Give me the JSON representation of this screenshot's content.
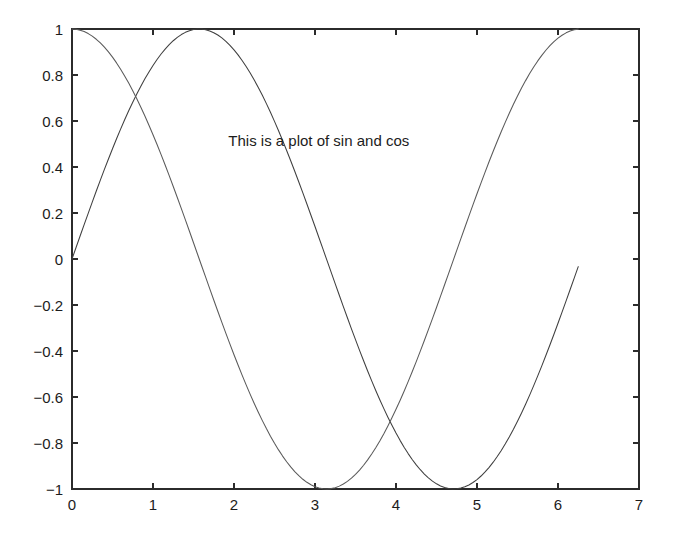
{
  "figure": {
    "background_color": "#ffffff",
    "axes_color": "#2b2b2b",
    "text_color": "#1c1c1c"
  },
  "chart_data": {
    "type": "line",
    "title": "",
    "subtitle": "",
    "xlabel": "",
    "ylabel": "",
    "xlim": [
      0,
      7
    ],
    "ylim": [
      -1,
      1
    ],
    "grid": false,
    "legend": null,
    "legend_position": "none",
    "box": true,
    "tick_direction": "in",
    "xticks": [
      0,
      1,
      2,
      3,
      4,
      5,
      6,
      7
    ],
    "xticklabels": [
      "0",
      "1",
      "2",
      "3",
      "4",
      "5",
      "6",
      "7"
    ],
    "yticks": [
      -1,
      -0.8,
      -0.6,
      -0.4,
      -0.2,
      0,
      0.2,
      0.4,
      0.6,
      0.8,
      1
    ],
    "yticklabels": [
      "-1",
      "-0.8",
      "-0.6",
      "-0.4",
      "-0.2",
      "0",
      "0.2",
      "0.4",
      "0.6",
      "0.8",
      "1"
    ],
    "x_domain_of_data": [
      0,
      6.2832
    ],
    "x_step": 0.05,
    "series": [
      {
        "name": "sin",
        "function": "sin(x)",
        "color": "#3f3f3f",
        "linewidth": 1.05,
        "key_points": [
          {
            "x": 0,
            "y": 0
          },
          {
            "x": 0.7854,
            "y": 0.7071
          },
          {
            "x": 1.5708,
            "y": 1
          },
          {
            "x": 3.1416,
            "y": 0
          },
          {
            "x": 3.927,
            "y": -0.7071
          },
          {
            "x": 4.7124,
            "y": -1
          },
          {
            "x": 6.2832,
            "y": 0
          }
        ]
      },
      {
        "name": "cos",
        "function": "cos(x)",
        "color": "#5a5a5a",
        "linewidth": 1.05,
        "key_points": [
          {
            "x": 0,
            "y": 1
          },
          {
            "x": 0.7854,
            "y": 0.7071
          },
          {
            "x": 1.5708,
            "y": 0
          },
          {
            "x": 3.1416,
            "y": -1
          },
          {
            "x": 3.927,
            "y": -0.7071
          },
          {
            "x": 4.7124,
            "y": 0
          },
          {
            "x": 6.2832,
            "y": 1
          }
        ]
      }
    ],
    "annotations": [
      {
        "text": "This is a plot of sin and cos",
        "x": 1.93,
        "y": 0.49,
        "anchor": "start"
      }
    ]
  }
}
